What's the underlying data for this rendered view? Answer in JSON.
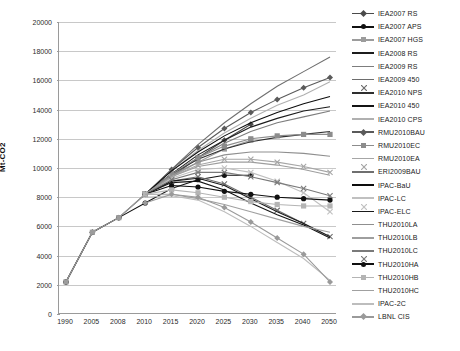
{
  "chart_data": {
    "type": "line",
    "title": "",
    "subtitle": "",
    "xlabel": "",
    "ylabel": "Mt-CO2",
    "grid": true,
    "legend_position": "right",
    "ylim": [
      0,
      20000
    ],
    "ytick_step": 2000,
    "yticks": [
      "0",
      "2000",
      "4000",
      "6000",
      "8000",
      "10000",
      "12000",
      "14000",
      "16000",
      "18000",
      "20000"
    ],
    "categories": [
      "1990",
      "2005",
      "2008",
      "2010",
      "2015",
      "2020",
      "2025",
      "2030",
      "2035",
      "2040",
      "2050"
    ],
    "x": [
      1990,
      2005,
      2008,
      2010,
      2015,
      2020,
      2025,
      2030,
      2035,
      2040,
      2050
    ],
    "series": [
      {
        "name": "IEA2007 RS",
        "color": "#4a4a4a",
        "marker": "diamond",
        "values": [
          2200,
          5600,
          6600,
          8200,
          9400,
          10700,
          11900,
          13000,
          null,
          null,
          null
        ]
      },
      {
        "name": "IEA2007 APS",
        "color": "#111111",
        "marker": "circle",
        "values": [
          2200,
          5600,
          6600,
          7600,
          8600,
          9200,
          9500,
          9500,
          null,
          null,
          null
        ]
      },
      {
        "name": "IEA2007 HGS",
        "color": "#9c9c9c",
        "marker": "square",
        "values": [
          2200,
          5600,
          6600,
          8200,
          9400,
          10400,
          11300,
          11900,
          null,
          null,
          null
        ]
      },
      {
        "name": "IEA2008 RS",
        "color": "#1c1c1c",
        "marker": "none",
        "values": [
          null,
          null,
          null,
          8200,
          9600,
          10900,
          11900,
          12800,
          13400,
          13900,
          14200
        ]
      },
      {
        "name": "IEA2009 RS",
        "color": "#7d7d7d",
        "marker": "none",
        "values": [
          null,
          null,
          null,
          8200,
          9500,
          10700,
          11700,
          12500,
          13100,
          13500,
          13900
        ]
      },
      {
        "name": "IEA2009 450",
        "color": "#6d6d6d",
        "marker": "cross",
        "values": [
          null,
          null,
          null,
          8200,
          9100,
          9400,
          8900,
          8000,
          7100,
          6200,
          5300
        ]
      },
      {
        "name": "IEA2010 NPS",
        "color": "#2e2e2e",
        "marker": "none",
        "values": [
          null,
          null,
          null,
          8200,
          9600,
          10600,
          11300,
          11800,
          12100,
          12300,
          12500
        ]
      },
      {
        "name": "IEA2010 450",
        "color": "#141414",
        "marker": "none",
        "values": [
          null,
          null,
          null,
          8200,
          9000,
          9100,
          8500,
          7600,
          6800,
          6100,
          5200
        ]
      },
      {
        "name": "IEA2010 CPS",
        "color": "#b0b0b0",
        "marker": "none",
        "values": [
          null,
          null,
          null,
          8200,
          9800,
          11200,
          12400,
          13400,
          14300,
          15000,
          15900
        ]
      },
      {
        "name": "RMU2010BAU",
        "color": "#5a5a5a",
        "marker": "diamond",
        "values": [
          null,
          null,
          null,
          8200,
          9900,
          11400,
          12700,
          13800,
          14700,
          15500,
          16200
        ]
      },
      {
        "name": "RMU2010EC",
        "color": "#8c8c8c",
        "marker": "square",
        "values": [
          null,
          null,
          null,
          8200,
          9600,
          10700,
          11500,
          12000,
          12200,
          12300,
          12300
        ]
      },
      {
        "name": "RMU2010EA",
        "color": "#a6a6a6",
        "marker": "cross",
        "values": [
          null,
          null,
          null,
          8200,
          9400,
          10200,
          10600,
          10600,
          10400,
          10100,
          9700
        ]
      },
      {
        "name": "ERI2009BAU",
        "color": "#6f6f6f",
        "marker": "none",
        "values": [
          null,
          null,
          null,
          8200,
          9900,
          11600,
          13100,
          14400,
          15600,
          16600,
          17600
        ]
      },
      {
        "name": "IPAC-BaU",
        "color": "#0d0d0d",
        "marker": "none",
        "values": [
          null,
          null,
          null,
          8200,
          9800,
          11100,
          12200,
          13100,
          13800,
          14400,
          14900
        ]
      },
      {
        "name": "IPAC-LC",
        "color": "#c0c0c0",
        "marker": "cross",
        "values": [
          null,
          null,
          null,
          8200,
          9300,
          9900,
          10000,
          9700,
          9100,
          8300,
          7000
        ]
      },
      {
        "name": "IPAC-ELC",
        "color": "#1a1a1a",
        "marker": "none",
        "values": [
          null,
          null,
          null,
          8200,
          9100,
          9300,
          8800,
          7900,
          7000,
          6200,
          5300
        ]
      },
      {
        "name": "THU2010LA",
        "color": "#8f8f8f",
        "marker": "none",
        "values": [
          null,
          null,
          null,
          8200,
          9500,
          10400,
          10900,
          11100,
          11100,
          11000,
          10800
        ]
      },
      {
        "name": "THU2010LB",
        "color": "#9e9e9e",
        "marker": "none",
        "values": [
          null,
          null,
          null,
          8200,
          9400,
          10100,
          10400,
          10400,
          10200,
          9900,
          9500
        ]
      },
      {
        "name": "THU2010LC",
        "color": "#7a7a7a",
        "marker": "cross",
        "values": [
          null,
          null,
          null,
          8200,
          9200,
          9700,
          9700,
          9400,
          9000,
          8600,
          8100
        ]
      },
      {
        "name": "THU2010HA",
        "color": "#101010",
        "marker": "circle",
        "values": [
          null,
          null,
          null,
          8200,
          8800,
          8700,
          8400,
          8200,
          8000,
          7900,
          7800
        ]
      },
      {
        "name": "THU2010HB",
        "color": "#b4b4b4",
        "marker": "square",
        "values": [
          null,
          null,
          null,
          8200,
          8500,
          8300,
          8000,
          7700,
          7500,
          7400,
          7400
        ]
      },
      {
        "name": "THU2010HC",
        "color": "#a0a0a0",
        "marker": "none",
        "values": [
          null,
          null,
          null,
          8200,
          8200,
          7900,
          7500,
          7000,
          6500,
          6000,
          5600
        ]
      },
      {
        "name": "IPAC-2C",
        "color": "#bdbdbd",
        "marker": "none",
        "values": [
          null,
          null,
          null,
          8000,
          8100,
          7800,
          7000,
          6000,
          4900,
          3800,
          2300
        ]
      },
      {
        "name": "LBNL CIS",
        "color": "#9a9a9a",
        "marker": "diamond",
        "values": [
          null,
          null,
          null,
          7600,
          8200,
          8000,
          7300,
          6300,
          5200,
          4100,
          2200
        ]
      }
    ]
  },
  "legend": {
    "entries": [
      "IEA2007 RS",
      "IEA2007 APS",
      "IEA2007 HGS",
      "IEA2008 RS",
      "IEA2009 RS",
      "IEA2009 450",
      "IEA2010 NPS",
      "IEA2010 450",
      "IEA2010 CPS",
      "RMU2010BAU",
      "RMU2010EC",
      "RMU2010EA",
      "ERI2009BAU",
      "IPAC-BaU",
      "IPAC-LC",
      "IPAC-ELC",
      "THU2010LA",
      "THU2010LB",
      "THU2010LC",
      "THU2010HA",
      "THU2010HB",
      "THU2010HC",
      "IPAC-2C",
      "LBNL CIS"
    ]
  }
}
